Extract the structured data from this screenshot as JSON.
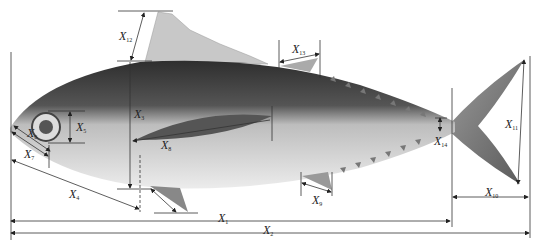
{
  "diagram": {
    "type": "fish morphometric measurement diagram",
    "colors": {
      "line": "#333333",
      "fish_dark": "#3a3a3a",
      "fish_light": "#d8d8d8",
      "fin": "#8a8a8a"
    },
    "labels": {
      "x1": {
        "base": "X",
        "sub": "1"
      },
      "x2": {
        "base": "X",
        "sub": "2"
      },
      "x3": {
        "base": "X",
        "sub": "3"
      },
      "x4": {
        "base": "X",
        "sub": "4"
      },
      "x5": {
        "base": "X",
        "sub": "5"
      },
      "x6": {
        "base": "X",
        "sub": "6"
      },
      "x7": {
        "base": "X",
        "sub": "7"
      },
      "x8": {
        "base": "X",
        "sub": "8"
      },
      "x9": {
        "base": "X",
        "sub": "9"
      },
      "x10": {
        "base": "X",
        "sub": "10"
      },
      "x11": {
        "base": "X",
        "sub": "11"
      },
      "x12": {
        "base": "X",
        "sub": "12"
      },
      "x13": {
        "base": "X",
        "sub": "13"
      },
      "x14": {
        "base": "X",
        "sub": "14"
      }
    }
  }
}
